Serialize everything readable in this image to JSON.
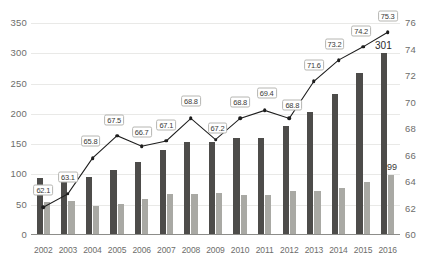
{
  "chart_data": {
    "type": "bar",
    "title": "",
    "xlabel": "",
    "ylabel": "",
    "grid": true,
    "legend": "none",
    "categories": [
      "2002",
      "2003",
      "2004",
      "2005",
      "2006",
      "2007",
      "2008",
      "2009",
      "2010",
      "2011",
      "2012",
      "2013",
      "2014",
      "2015",
      "2016"
    ],
    "left_axis": {
      "ylim": [
        0,
        350
      ],
      "ticks": [
        "0",
        "50",
        "100",
        "150",
        "200",
        "250",
        "300",
        "350"
      ],
      "tick_values": [
        0,
        50,
        100,
        150,
        200,
        250,
        300,
        350
      ]
    },
    "right_axis": {
      "ylim": [
        60,
        76
      ],
      "ticks": [
        "60",
        "62",
        "64",
        "66",
        "68",
        "70",
        "72",
        "74",
        "76"
      ],
      "tick_values": [
        60,
        62,
        64,
        66,
        68,
        70,
        72,
        74,
        76
      ]
    },
    "series": [
      {
        "name": "primary-bars",
        "chart_type": "bar",
        "axis": "left",
        "color": "#4d4c4a",
        "values": [
          94,
          98,
          96,
          108,
          121,
          140,
          154,
          153,
          160,
          161,
          180,
          203,
          233,
          268,
          301
        ],
        "labels": [
          "",
          "",
          "",
          "",
          "",
          "",
          "",
          "",
          "",
          "",
          "",
          "",
          "",
          "",
          "301"
        ]
      },
      {
        "name": "secondary-bars",
        "chart_type": "bar",
        "axis": "left",
        "color": "#a9a9a4",
        "values": [
          55,
          56,
          48,
          51,
          60,
          67,
          67,
          69,
          66,
          66,
          73,
          73,
          77,
          88,
          99
        ],
        "labels": [
          "",
          "",
          "",
          "",
          "",
          "",
          "",
          "",
          "",
          "",
          "",
          "",
          "",
          "",
          "99"
        ]
      },
      {
        "name": "rate-line",
        "chart_type": "line",
        "axis": "right",
        "color": "#1d1d1d",
        "values": [
          62.1,
          63.1,
          65.8,
          67.5,
          66.7,
          67.1,
          68.8,
          67.2,
          68.8,
          69.4,
          68.8,
          71.6,
          73.2,
          74.2,
          75.3
        ],
        "labels": [
          "62.1",
          "63.1",
          "65.8",
          "67.5",
          "66.7",
          "67.1",
          "68.8",
          "67.2",
          "68.8",
          "69.4",
          "68.8",
          "71.6",
          "73.2",
          "74.2",
          "75.3"
        ]
      }
    ]
  },
  "colors": {
    "primary_bar": "#4d4c4a",
    "secondary_bar": "#a9a9a4",
    "line": "#1d1d1d",
    "gridline": "#e9e9e7",
    "axis_text": "#6d6d6b",
    "background": "#ffffff"
  }
}
